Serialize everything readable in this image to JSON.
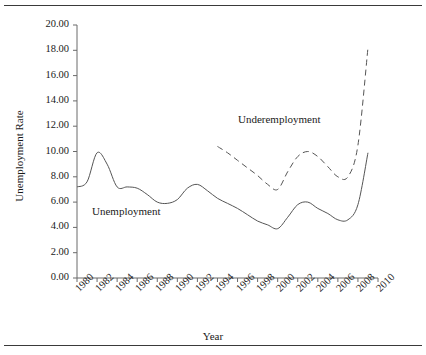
{
  "chart_data": {
    "type": "line",
    "title": "",
    "xlabel": "Year",
    "ylabel": "Unemployment Rate",
    "xlim": [
      1980,
      2010
    ],
    "ylim": [
      0.0,
      20.0
    ],
    "grid": false,
    "legend_position": "inline-annotation",
    "xticks": [
      "1980",
      "1982",
      "1984",
      "1986",
      "1988",
      "1990",
      "1992",
      "1994",
      "1996",
      "1998",
      "2000",
      "2002",
      "2004",
      "2006",
      "2008",
      "2010"
    ],
    "yticks": [
      "0.00",
      "2.00",
      "4.00",
      "6.00",
      "8.00",
      "10.00",
      "12.00",
      "14.00",
      "16.00",
      "18.00",
      "20.00"
    ],
    "series": [
      {
        "name": "Unemployment",
        "style": "solid",
        "color": "#555555",
        "x": [
          1980,
          1981,
          1982,
          1983,
          1984,
          1985,
          1986,
          1987,
          1988,
          1989,
          1990,
          1991,
          1992,
          1993,
          1994,
          1995,
          1996,
          1997,
          1998,
          1999,
          2000,
          2001,
          2002,
          2003,
          2004,
          2005,
          2006,
          2007,
          2008,
          2009
        ],
        "values": [
          7.2,
          7.6,
          9.9,
          9.0,
          7.2,
          7.2,
          7.1,
          6.6,
          6.0,
          5.9,
          6.2,
          7.1,
          7.4,
          6.9,
          6.3,
          5.9,
          5.5,
          5.0,
          4.5,
          4.2,
          3.9,
          4.8,
          5.8,
          6.0,
          5.5,
          5.1,
          4.6,
          4.6,
          5.8,
          9.9
        ]
      },
      {
        "name": "Underemployment",
        "style": "dashed",
        "color": "#555555",
        "x": [
          1994,
          1995,
          1996,
          1997,
          1998,
          1999,
          2000,
          2001,
          2002,
          2003,
          2004,
          2005,
          2006,
          2007,
          2008,
          2009
        ],
        "values": [
          10.4,
          9.9,
          9.3,
          8.7,
          8.1,
          7.4,
          7.0,
          8.4,
          9.6,
          10.0,
          9.6,
          8.8,
          8.0,
          8.0,
          10.5,
          18.2
        ]
      }
    ]
  },
  "annotations": {
    "unemployment_label": "Unemployment",
    "underemployment_label": "Underemployment"
  },
  "figure": {
    "top_rule": "",
    "bottom_rule": ""
  }
}
